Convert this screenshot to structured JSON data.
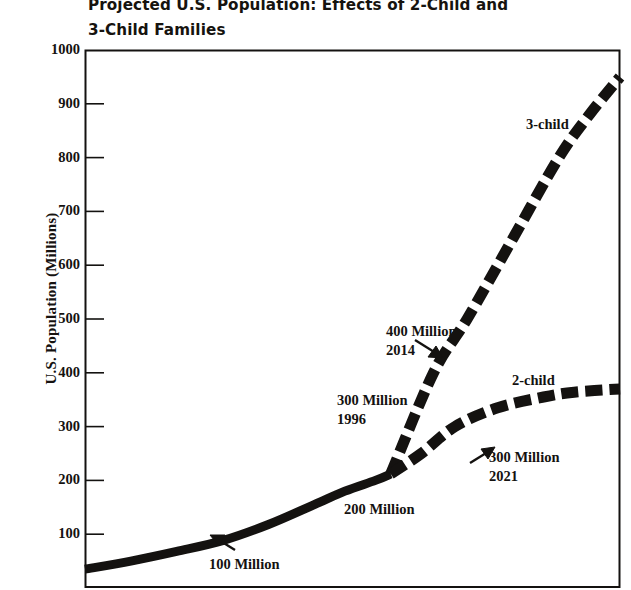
{
  "chart_data": {
    "type": "line",
    "title": "Projected U.S. Population: Effects of 2-Child and\n3-Child Families",
    "xlabel": "",
    "ylabel": "U.S. Population (Millions)",
    "ylim": [
      0,
      1000
    ],
    "yticks": [
      100,
      200,
      300,
      400,
      500,
      600,
      700,
      800,
      900,
      1000
    ],
    "ytick_labels": [
      "100",
      "200",
      "300",
      "400",
      "500",
      "600",
      "700",
      "800",
      "900",
      "1000"
    ],
    "grid": false,
    "legend_position": "inline-curve-labels",
    "xlim": [
      1900,
      2075
    ],
    "x_axis_note": "x tick labels are cropped below the bottom edge of the image; major and minor ticks alternate along the bottom axis",
    "series": [
      {
        "name": "common-history",
        "label": "",
        "style": "solid",
        "x": [
          1900,
          1915,
          1930,
          1945,
          1960,
          1975,
          1985,
          1995,
          2000
        ],
        "values": [
          35,
          50,
          68,
          88,
          118,
          155,
          180,
          200,
          212
        ]
      },
      {
        "name": "2-child",
        "label": "2-child",
        "style": "dashed",
        "x": [
          2000,
          2010,
          2021,
          2035,
          2050,
          2060,
          2075
        ],
        "values": [
          212,
          250,
          300,
          335,
          355,
          364,
          370
        ]
      },
      {
        "name": "3-child",
        "label": "3-child",
        "style": "dashed",
        "x": [
          2000,
          2014,
          2025,
          2040,
          2055,
          2065,
          2075
        ],
        "values": [
          212,
          400,
          500,
          650,
          800,
          880,
          950
        ]
      }
    ],
    "annotations": [
      {
        "name": "100-million",
        "text": "100 Million",
        "value": 100,
        "year": 1915
      },
      {
        "name": "200-million",
        "text": "200 Million",
        "value": 200,
        "year": 1968
      },
      {
        "name": "300-million-1996",
        "text": "300 Million\n1996",
        "value": 300,
        "year": 1996
      },
      {
        "name": "400-million-2014",
        "text": "400 Million\n2014",
        "value": 400,
        "year": 2014
      },
      {
        "name": "300-million-2021",
        "text": "300 Million\n2021",
        "value": 300,
        "year": 2021
      }
    ]
  },
  "chart": {
    "title": "Projected U.S. Population: Effects of 2-Child and\n3-Child Families",
    "ylabel": "U.S. Population (Millions)",
    "yticks": [
      {
        "label": "1000"
      },
      {
        "label": "900"
      },
      {
        "label": "800"
      },
      {
        "label": "700"
      },
      {
        "label": "600"
      },
      {
        "label": "500"
      },
      {
        "label": "400"
      },
      {
        "label": "300"
      },
      {
        "label": "200"
      },
      {
        "label": "100"
      }
    ],
    "series_labels": {
      "three_child": "3-child",
      "two_child": "2-child"
    },
    "annotations": {
      "m100": "100 Million",
      "m200": "200 Million",
      "m300_1996": "300 Million\n1996",
      "m400_2014": "400 Million\n2014",
      "m300_2021": "300 Million\n2021"
    },
    "colors": {
      "ink": "#141210",
      "background": "#ffffff"
    }
  }
}
